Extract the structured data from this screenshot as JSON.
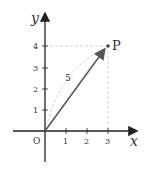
{
  "diagram": {
    "axis_x_label": "x",
    "axis_y_label": "y",
    "origin_label": "O",
    "x_ticks": [
      "1",
      "2",
      "3"
    ],
    "y_ticks": [
      "1",
      "2",
      "3",
      "4"
    ],
    "point_label": "P",
    "point": {
      "x": 3,
      "y": 4
    },
    "magnitude_label": "5",
    "colors": {
      "axis": "#222222",
      "vector": "#555555",
      "dashed": "#bbbbbb"
    }
  }
}
